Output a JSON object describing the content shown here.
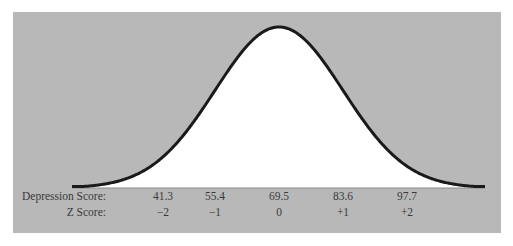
{
  "colors": {
    "panel_bg": "#b8b8b8",
    "curve_fill": "#ffffff",
    "curve_stroke": "#1a1a1a",
    "text": "#3a3a3a"
  },
  "chart_data": {
    "type": "area",
    "title": "",
    "distribution": {
      "mean": 69.5,
      "sd": 14.1
    },
    "rows": [
      {
        "label": "Depression Score:",
        "values": [
          "41.3",
          "55.4",
          "69.5",
          "83.6",
          "97.7"
        ]
      },
      {
        "label": "Z Score:",
        "values": [
          "−2",
          "−1",
          "0",
          "+1",
          "+2"
        ]
      }
    ],
    "z_positions": [
      -2,
      -1,
      0,
      1,
      2
    ],
    "grid": false,
    "legend": null
  },
  "labels": {
    "depression_label": "Depression Score:",
    "z_label": "Z Score:"
  },
  "depression_scores": [
    "41.3",
    "55.4",
    "69.5",
    "83.6",
    "97.7"
  ],
  "z_scores": [
    "−2",
    "−1",
    "0",
    "+1",
    "+2"
  ]
}
